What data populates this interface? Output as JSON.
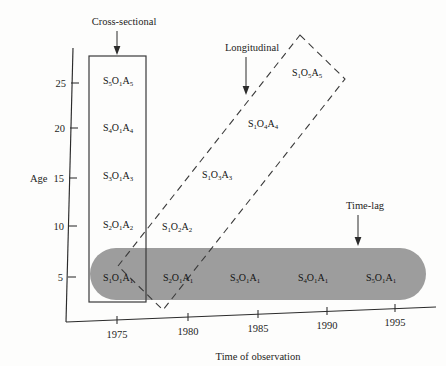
{
  "figure": {
    "background_color": "#fdfdfc",
    "ink_color": "#1d1d1d",
    "gray_band_color": "#9d9d9d"
  },
  "axes": {
    "y": {
      "title": "Age",
      "ticks": [
        {
          "label": "5",
          "value": 5
        },
        {
          "label": "10",
          "value": 10
        },
        {
          "label": "15",
          "value": 15
        },
        {
          "label": "20",
          "value": 20
        },
        {
          "label": "25",
          "value": 25
        }
      ]
    },
    "x": {
      "title": "Time of observation",
      "ticks": [
        {
          "label": "1975",
          "value": 1975
        },
        {
          "label": "1980",
          "value": 1980
        },
        {
          "label": "1985",
          "value": 1985
        },
        {
          "label": "1990",
          "value": 1990
        },
        {
          "label": "1995",
          "value": 1995
        }
      ]
    }
  },
  "annotations": [
    {
      "name": "cross-sectional",
      "label": "Cross-sectional"
    },
    {
      "name": "longitudinal",
      "label": "Longitudinal"
    },
    {
      "name": "time-lag",
      "label": "Time-lag"
    }
  ],
  "chart_data": {
    "type": "scatter",
    "title": "",
    "xlabel": "Time of observation",
    "ylabel": "Age",
    "xlim": [
      1972,
      1997
    ],
    "ylim": [
      0,
      28
    ],
    "grid": false,
    "legend": "none",
    "annotations": [
      "Cross-sectional",
      "Longitudinal",
      "Time-lag"
    ],
    "series": [
      {
        "name": "Cross-sectional",
        "shape": "solid-rectangle",
        "points": [
          {
            "cell": "S5O1A5",
            "S": 5,
            "O": 1,
            "A": 5,
            "year": 1975,
            "age": 25,
            "label_parts": [
              "S",
              "5",
              "O",
              "1",
              "A",
              "5"
            ]
          },
          {
            "cell": "S4O1A4",
            "S": 4,
            "O": 1,
            "A": 4,
            "year": 1975,
            "age": 20,
            "label_parts": [
              "S",
              "4",
              "O",
              "1",
              "A",
              "4"
            ]
          },
          {
            "cell": "S3O1A3",
            "S": 3,
            "O": 1,
            "A": 3,
            "year": 1975,
            "age": 15,
            "label_parts": [
              "S",
              "3",
              "O",
              "1",
              "A",
              "3"
            ]
          },
          {
            "cell": "S2O1A2",
            "S": 2,
            "O": 1,
            "A": 2,
            "year": 1975,
            "age": 10,
            "label_parts": [
              "S",
              "2",
              "O",
              "1",
              "A",
              "2"
            ]
          },
          {
            "cell": "S1O1A1",
            "S": 1,
            "O": 1,
            "A": 1,
            "year": 1975,
            "age": 5,
            "label_parts": [
              "S",
              "1",
              "O",
              "1",
              "A",
              "1"
            ]
          }
        ]
      },
      {
        "name": "Longitudinal",
        "shape": "dashed-parallelogram",
        "points": [
          {
            "cell": "S1O1A1",
            "S": 1,
            "O": 1,
            "A": 1,
            "year": 1975,
            "age": 5,
            "label_parts": [
              "S",
              "1",
              "O",
              "1",
              "A",
              "1"
            ]
          },
          {
            "cell": "S1O2A2",
            "S": 1,
            "O": 2,
            "A": 2,
            "year": 1980,
            "age": 10,
            "label_parts": [
              "S",
              "1",
              "O",
              "2",
              "A",
              "2"
            ]
          },
          {
            "cell": "S1O3A3",
            "S": 1,
            "O": 3,
            "A": 3,
            "year": 1985,
            "age": 15,
            "label_parts": [
              "S",
              "1",
              "O",
              "3",
              "A",
              "3"
            ]
          },
          {
            "cell": "S1O4A4",
            "S": 1,
            "O": 4,
            "A": 4,
            "year": 1990,
            "age": 20,
            "label_parts": [
              "S",
              "1",
              "O",
              "4",
              "A",
              "4"
            ]
          },
          {
            "cell": "S1O5A5",
            "S": 1,
            "O": 5,
            "A": 5,
            "year": 1995,
            "age": 25,
            "label_parts": [
              "S",
              "1",
              "O",
              "5",
              "A",
              "5"
            ]
          }
        ]
      },
      {
        "name": "Time-lag",
        "shape": "gray-rounded-band",
        "points": [
          {
            "cell": "S1O1A1",
            "S": 1,
            "O": 1,
            "A": 1,
            "year": 1975,
            "age": 5,
            "label_parts": [
              "S",
              "1",
              "O",
              "1",
              "A",
              "1"
            ]
          },
          {
            "cell": "S2O1A1",
            "S": 2,
            "O": 1,
            "A": 1,
            "year": 1980,
            "age": 5,
            "label_parts": [
              "S",
              "2",
              "O",
              "1",
              "A",
              "1"
            ]
          },
          {
            "cell": "S3O1A1",
            "S": 3,
            "O": 1,
            "A": 1,
            "year": 1985,
            "age": 5,
            "label_parts": [
              "S",
              "3",
              "O",
              "1",
              "A",
              "1"
            ]
          },
          {
            "cell": "S4O1A1",
            "S": 4,
            "O": 1,
            "A": 1,
            "year": 1990,
            "age": 5,
            "label_parts": [
              "S",
              "4",
              "O",
              "1",
              "A",
              "1"
            ]
          },
          {
            "cell": "S5O1A1",
            "S": 5,
            "O": 1,
            "A": 1,
            "year": 1995,
            "age": 5,
            "label_parts": [
              "S",
              "5",
              "O",
              "1",
              "A",
              "1"
            ]
          }
        ]
      }
    ]
  }
}
